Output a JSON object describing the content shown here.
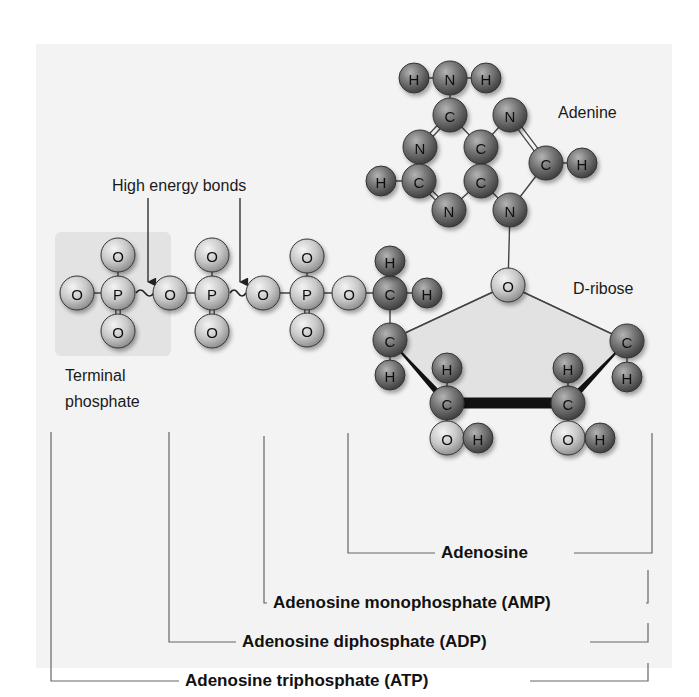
{
  "panel": {
    "x": 36,
    "y": 44,
    "w": 636,
    "h": 624,
    "color": "#f3f3f3"
  },
  "terminal_box": {
    "x": 55,
    "y": 232,
    "w": 116,
    "h": 124,
    "color": "#e3e3e3"
  },
  "labels": {
    "high_energy_bonds": {
      "text": "High energy bonds",
      "x": 112,
      "y": 191
    },
    "adenine": {
      "text": "Adenine",
      "x": 558,
      "y": 118
    },
    "d_ribose": {
      "text": "D-ribose",
      "x": 573,
      "y": 294
    },
    "terminal_line1": {
      "text": "Terminal",
      "x": 65,
      "y": 381
    },
    "terminal_line2": {
      "text": "phosphate",
      "x": 65,
      "y": 407
    }
  },
  "arrows": [
    {
      "x": 148,
      "y1": 198,
      "y2": 282
    },
    {
      "x": 240,
      "y1": 198,
      "y2": 282
    }
  ],
  "colors": {
    "dark_atom": "#6a6a6a",
    "light_atom": "#c8c8c8",
    "bond": "#444444",
    "ribose_fill": "#e2e2e2"
  },
  "atoms": [
    {
      "id": "Pa_O1",
      "el": "O",
      "x": 77,
      "y": 293,
      "tone": "light"
    },
    {
      "id": "Pa_P",
      "el": "P",
      "x": 118,
      "y": 293,
      "tone": "light"
    },
    {
      "id": "Pa_Ot",
      "el": "O",
      "x": 118,
      "y": 255,
      "tone": "light"
    },
    {
      "id": "Pa_Ob",
      "el": "O",
      "x": 118,
      "y": 331,
      "tone": "light"
    },
    {
      "id": "Pb_O1",
      "el": "O",
      "x": 170,
      "y": 293,
      "tone": "light"
    },
    {
      "id": "Pb_P",
      "el": "P",
      "x": 212,
      "y": 293,
      "tone": "light"
    },
    {
      "id": "Pb_Ot",
      "el": "O",
      "x": 212,
      "y": 255,
      "tone": "light"
    },
    {
      "id": "Pb_Ob",
      "el": "O",
      "x": 212,
      "y": 331,
      "tone": "light"
    },
    {
      "id": "Pc_O1",
      "el": "O",
      "x": 263,
      "y": 293,
      "tone": "light"
    },
    {
      "id": "Pc_P",
      "el": "P",
      "x": 307,
      "y": 293,
      "tone": "light"
    },
    {
      "id": "Pc_Ot",
      "el": "O",
      "x": 307,
      "y": 256,
      "tone": "light"
    },
    {
      "id": "Pc_Ob",
      "el": "O",
      "x": 307,
      "y": 330,
      "tone": "light"
    },
    {
      "id": "O5",
      "el": "O",
      "x": 349,
      "y": 293,
      "tone": "light"
    },
    {
      "id": "C5",
      "el": "C",
      "x": 390,
      "y": 293,
      "tone": "dark"
    },
    {
      "id": "H5a",
      "el": "H",
      "x": 390,
      "y": 261,
      "tone": "dark"
    },
    {
      "id": "H5b",
      "el": "H",
      "x": 427,
      "y": 293,
      "tone": "dark"
    },
    {
      "id": "C4",
      "el": "C",
      "x": 390,
      "y": 340,
      "tone": "dark"
    },
    {
      "id": "H4",
      "el": "H",
      "x": 390,
      "y": 375,
      "tone": "dark"
    },
    {
      "id": "O4",
      "el": "O",
      "x": 508,
      "y": 285,
      "tone": "light"
    },
    {
      "id": "C1",
      "el": "C",
      "x": 627,
      "y": 341,
      "tone": "dark"
    },
    {
      "id": "H1",
      "el": "H",
      "x": 627,
      "y": 377,
      "tone": "dark"
    },
    {
      "id": "C3",
      "el": "C",
      "x": 447,
      "y": 403,
      "tone": "dark"
    },
    {
      "id": "H3",
      "el": "H",
      "x": 447,
      "y": 368,
      "tone": "dark"
    },
    {
      "id": "O3",
      "el": "O",
      "x": 447,
      "y": 438,
      "tone": "light"
    },
    {
      "id": "HO3",
      "el": "H",
      "x": 478,
      "y": 438,
      "tone": "dark"
    },
    {
      "id": "C2",
      "el": "C",
      "x": 568,
      "y": 403,
      "tone": "dark"
    },
    {
      "id": "H2",
      "el": "H",
      "x": 568,
      "y": 368,
      "tone": "dark"
    },
    {
      "id": "O2",
      "el": "O",
      "x": 568,
      "y": 438,
      "tone": "light"
    },
    {
      "id": "HO2",
      "el": "H",
      "x": 600,
      "y": 438,
      "tone": "dark"
    },
    {
      "id": "Ah1",
      "el": "H",
      "x": 414,
      "y": 78,
      "tone": "dark"
    },
    {
      "id": "AN6",
      "el": "N",
      "x": 450,
      "y": 78,
      "tone": "dark"
    },
    {
      "id": "Ah2",
      "el": "H",
      "x": 486,
      "y": 78,
      "tone": "dark"
    },
    {
      "id": "AC6",
      "el": "C",
      "x": 450,
      "y": 115,
      "tone": "dark"
    },
    {
      "id": "AN7",
      "el": "N",
      "x": 510,
      "y": 115,
      "tone": "dark"
    },
    {
      "id": "AN1",
      "el": "N",
      "x": 420,
      "y": 147,
      "tone": "dark"
    },
    {
      "id": "AC5",
      "el": "C",
      "x": 481,
      "y": 147,
      "tone": "dark"
    },
    {
      "id": "AC8",
      "el": "C",
      "x": 546,
      "y": 163,
      "tone": "dark"
    },
    {
      "id": "AH8",
      "el": "H",
      "x": 582,
      "y": 163,
      "tone": "dark"
    },
    {
      "id": "AH2",
      "el": "H",
      "x": 381,
      "y": 181,
      "tone": "dark"
    },
    {
      "id": "AC2",
      "el": "C",
      "x": 419,
      "y": 181,
      "tone": "dark"
    },
    {
      "id": "AC4",
      "el": "C",
      "x": 481,
      "y": 181,
      "tone": "dark"
    },
    {
      "id": "AN3",
      "el": "N",
      "x": 449,
      "y": 210,
      "tone": "dark"
    },
    {
      "id": "AN9",
      "el": "N",
      "x": 510,
      "y": 210,
      "tone": "dark"
    }
  ],
  "bonds": [
    [
      "Pa_O1",
      "Pa_P",
      1
    ],
    [
      "Pa_P",
      "Pa_Ot",
      1
    ],
    [
      "Pa_P",
      "Pa_Ob",
      2
    ],
    [
      "Pb_O1",
      "Pb_P",
      1
    ],
    [
      "Pb_P",
      "Pb_Ot",
      1
    ],
    [
      "Pb_P",
      "Pb_Ob",
      2
    ],
    [
      "Pb_P",
      "Pc_O1",
      0
    ],
    [
      "Pc_O1",
      "Pc_P",
      1
    ],
    [
      "Pc_P",
      "Pc_Ot",
      1
    ],
    [
      "Pc_P",
      "Pc_Ob",
      2
    ],
    [
      "Pc_P",
      "O5",
      1
    ],
    [
      "O5",
      "C5",
      1
    ],
    [
      "C5",
      "H5a",
      1
    ],
    [
      "C5",
      "H5b",
      1
    ],
    [
      "C5",
      "C4",
      1
    ],
    [
      "C4",
      "H4",
      1
    ],
    [
      "C4",
      "O4",
      1
    ],
    [
      "O4",
      "C1",
      1
    ],
    [
      "C1",
      "H1",
      1
    ],
    [
      "C3",
      "H3",
      1
    ],
    [
      "C3",
      "O3",
      1
    ],
    [
      "O3",
      "HO3",
      1
    ],
    [
      "C2",
      "H2",
      1
    ],
    [
      "C2",
      "O2",
      1
    ],
    [
      "O2",
      "HO2",
      1
    ],
    [
      "AN6",
      "Ah1",
      1
    ],
    [
      "AN6",
      "Ah2",
      1
    ],
    [
      "AN6",
      "AC6",
      1
    ],
    [
      "AC6",
      "AN1",
      2
    ],
    [
      "AC6",
      "AC5",
      1
    ],
    [
      "AC5",
      "AN7",
      1
    ],
    [
      "AN7",
      "AC8",
      2
    ],
    [
      "AC8",
      "AH8",
      1
    ],
    [
      "AC8",
      "AN9",
      1
    ],
    [
      "AN1",
      "AC2",
      2
    ],
    [
      "AC2",
      "AH2",
      1
    ],
    [
      "AC2",
      "AN3",
      2
    ],
    [
      "AN3",
      "AC4",
      1
    ],
    [
      "AC4",
      "AC5",
      2
    ],
    [
      "AC4",
      "AN9",
      1
    ],
    [
      "AN9",
      "O4",
      1
    ]
  ],
  "squiggles": [
    {
      "x1": 136,
      "x2": 154,
      "y": 293
    },
    {
      "x1": 230,
      "x2": 246,
      "y": 293
    }
  ],
  "ribose_ring": {
    "polygon": [
      [
        390,
        340
      ],
      [
        508,
        285
      ],
      [
        627,
        341
      ],
      [
        568,
        403
      ],
      [
        447,
        403
      ]
    ],
    "wedges": [
      {
        "from": [
          390,
          340
        ],
        "to": [
          447,
          403
        ],
        "w1": 1,
        "w2": 7
      },
      {
        "from": [
          627,
          341
        ],
        "to": [
          568,
          403
        ],
        "w1": 1,
        "w2": 7
      }
    ],
    "thick_edge": {
      "from": [
        447,
        403
      ],
      "to": [
        568,
        403
      ],
      "width": 11
    }
  },
  "brackets": [
    {
      "label": "Adenosine",
      "left_x": 348,
      "right_x": 652,
      "y": 558,
      "top": 433,
      "text_x": 441,
      "label_end_x": 568
    },
    {
      "label": "Adenosine monophosphate (AMP)",
      "left_x": 264,
      "right_x": 648,
      "y": 608,
      "top": 436,
      "text_x": 273,
      "label_end_x": 640,
      "bracket_top": 570
    },
    {
      "label": "Adenosine diphosphate (ADP)",
      "left_x": 169,
      "right_x": 648,
      "y": 647,
      "top": 432,
      "text_x": 242,
      "label_end_x": 584,
      "bracket_top": 623
    },
    {
      "label": "Adenosine triphosphate (ATP)",
      "left_x": 51,
      "right_x": 648,
      "y": 686,
      "top": 432,
      "text_x": 185,
      "label_end_x": 524,
      "bracket_top": 663
    }
  ]
}
